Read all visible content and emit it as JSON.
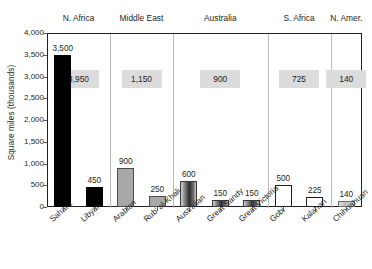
{
  "chart_data": {
    "type": "bar",
    "title": "",
    "xlabel": "",
    "ylabel": "Square miles (thousands)",
    "ylim": [
      0,
      4000
    ],
    "yticks": [
      "0",
      "500",
      "1,000",
      "1,500",
      "2,000",
      "2,500",
      "3,000",
      "3,500",
      "4,000"
    ],
    "grid": false,
    "legend": "none",
    "categories": [
      "Sahara",
      "Libyan",
      "Arabian",
      "Rub' al-Khali",
      "Australian",
      "Great Sandy",
      "Great Victoria",
      "Gobi",
      "Kalahari",
      "Chihuahuan"
    ],
    "values": [
      3500,
      450,
      900,
      250,
      600,
      150,
      150,
      500,
      225,
      140
    ],
    "value_labels": [
      "3,500",
      "450",
      "900",
      "250",
      "600",
      "150",
      "150",
      "500",
      "225",
      "140"
    ],
    "groups": [
      {
        "name": "N. Africa",
        "total": 3950,
        "total_label": "3,950",
        "members": [
          "Sahara",
          "Libyan"
        ],
        "fill": "black"
      },
      {
        "name": "Middle East",
        "total": 1150,
        "total_label": "1,150",
        "members": [
          "Arabian",
          "Rub' al-Khali"
        ],
        "fill": "gray"
      },
      {
        "name": "Australia",
        "total": 900,
        "total_label": "900",
        "members": [
          "Australian",
          "Great Sandy",
          "Great Victoria"
        ],
        "fill": "grad"
      },
      {
        "name": "S. Africa",
        "total": 725,
        "total_label": "725",
        "members": [
          "Gobi",
          "Kalahari"
        ],
        "fill": "white"
      },
      {
        "name": "N. Amer.",
        "total": 140,
        "total_label": "140",
        "members": [
          "Chihuahuan"
        ],
        "fill": "lite"
      }
    ]
  },
  "colors": {
    "axis": "#231f20",
    "divider": "#b9b9b9",
    "total_box": "#dcdcdc",
    "bar_black": "#000000",
    "bar_gray": "#a8a8a8",
    "bar_white": "#ffffff",
    "background": "#ffffff"
  }
}
